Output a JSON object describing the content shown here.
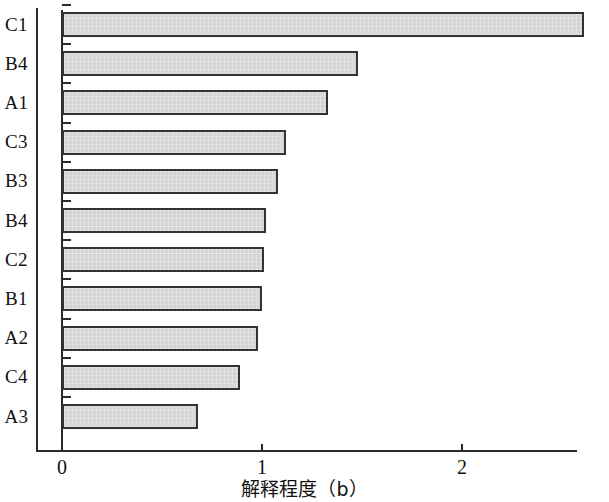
{
  "chart_data": {
    "type": "bar",
    "orientation": "horizontal",
    "title": "",
    "xlabel": "解释程度（b）",
    "ylabel": "",
    "categories": [
      "C1",
      "B4",
      "A1",
      "C3",
      "B3",
      "B4",
      "C2",
      "B1",
      "A2",
      "C4",
      "A3"
    ],
    "values": [
      2.61,
      1.48,
      1.33,
      1.12,
      1.08,
      1.02,
      1.01,
      1.0,
      0.98,
      0.89,
      0.68
    ],
    "series": [
      {
        "name": "解释程度（b）",
        "values": [
          2.61,
          1.48,
          1.33,
          1.12,
          1.08,
          1.02,
          1.01,
          1.0,
          0.98,
          0.89,
          0.68
        ]
      }
    ],
    "xlim": [
      0,
      2.7
    ],
    "xticks": [
      0,
      1,
      2
    ],
    "xtick_labels": [
      "0",
      "1",
      "2"
    ],
    "grid": false,
    "legend": false,
    "bar_fill_color": "#d4d4d4",
    "bar_edge_color": "#333333",
    "axis_color": "#2b2b2b",
    "background_color": "#ffffff"
  }
}
